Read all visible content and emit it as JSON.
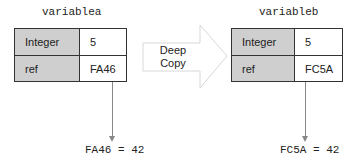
{
  "diagram": {
    "left": {
      "title": "variablea",
      "rows": [
        {
          "label": "Integer",
          "value": "5"
        },
        {
          "label": "ref",
          "value": "FA46"
        }
      ],
      "target": "FA46 = 42"
    },
    "arrow": {
      "label_line1": "Deep",
      "label_line2": "Copy"
    },
    "right": {
      "title": "variableb",
      "rows": [
        {
          "label": "Integer",
          "value": "5"
        },
        {
          "label": "ref",
          "value": "FC5A"
        }
      ],
      "target": "FC5A = 42"
    },
    "colors": {
      "label_fill": "#cfcfcf",
      "border": "#333333",
      "pointer": "#888888",
      "arrow_outline": "#d8d8d8"
    }
  }
}
